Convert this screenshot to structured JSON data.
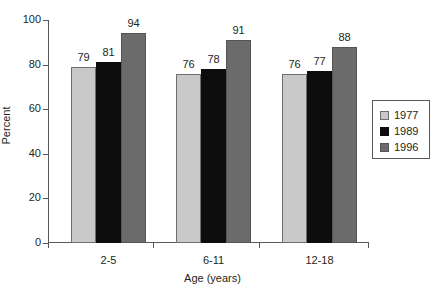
{
  "chart_data": {
    "type": "bar",
    "title": "",
    "xlabel": "Age (years)",
    "ylabel": "Percent",
    "categories": [
      "2-5",
      "6-11",
      "12-18"
    ],
    "series": [
      {
        "name": "1977",
        "color": "#c9c9c9",
        "values": [
          79,
          76,
          76
        ]
      },
      {
        "name": "1989",
        "color": "#0d0d0d",
        "values": [
          81,
          78,
          77
        ]
      },
      {
        "name": "1996",
        "color": "#6b6b6b",
        "values": [
          94,
          91,
          88
        ]
      }
    ],
    "ylim": [
      0,
      100
    ],
    "yticks": [
      0,
      20,
      40,
      60,
      80,
      100
    ],
    "ytick_labels": [
      "0",
      "20",
      "40",
      "60",
      "80",
      "100"
    ],
    "grid": false,
    "legend_position": "right",
    "data_labels": true
  },
  "legend": {
    "entries": [
      {
        "label": "1977"
      },
      {
        "label": "1989"
      },
      {
        "label": "1996"
      }
    ]
  }
}
